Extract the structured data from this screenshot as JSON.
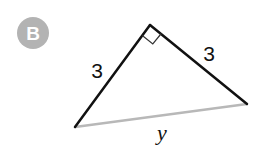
{
  "badge": {
    "label": "B",
    "color": "#b3b3b3"
  },
  "figure": {
    "type": "right triangle",
    "vertices": {
      "top": [
        150,
        25
      ],
      "left": [
        75,
        127
      ],
      "right": [
        247,
        104
      ]
    },
    "right_angle_at": "top",
    "legs": [
      {
        "label": "3",
        "side": "left"
      },
      {
        "label": "3",
        "side": "right"
      }
    ],
    "hypotenuse": {
      "label": "y",
      "color": "#b8b8b8"
    },
    "leg_color": "#111111"
  }
}
